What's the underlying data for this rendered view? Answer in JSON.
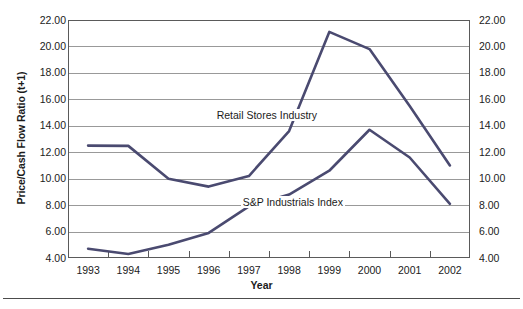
{
  "chart_data": {
    "type": "line",
    "title": "",
    "xlabel": "Year",
    "ylabel": "Price/Cash Flow Ratio (t+1)",
    "ylabel_right": "Price/Cash Flow Ratio (t+1)",
    "categories": [
      "1993",
      "1994",
      "1995",
      "1996",
      "1997",
      "1998",
      "1999",
      "2000",
      "2001",
      "2002"
    ],
    "x": [
      1993,
      1994,
      1995,
      1996,
      1997,
      1998,
      1999,
      2000,
      2001,
      2002
    ],
    "ylim": [
      4.0,
      22.0
    ],
    "ytick_values": [
      22.0,
      20.0,
      18.0,
      16.0,
      14.0,
      12.0,
      10.0,
      8.0,
      6.0,
      4.0
    ],
    "ytick_labels": [
      "22.00",
      "20.00",
      "18.00",
      "16.00",
      "14.00",
      "12.00",
      "10.00",
      "8.00",
      "6.00",
      "4.00"
    ],
    "ytick_labels_right": [
      "22.00",
      "20.00",
      "18.00",
      "16.00",
      "14.00",
      "12.00",
      "10.00",
      "8.00",
      "6.00",
      "4.00"
    ],
    "grid": true,
    "grid_axis": "y",
    "legend": "none",
    "legend_position": "inline-annotations",
    "series": [
      {
        "name": "Retail Stores Industry",
        "color": "#4a4a70",
        "values": [
          12.5,
          12.48,
          10.0,
          9.4,
          10.2,
          13.6,
          21.1,
          19.8,
          15.5,
          11.0
        ]
      },
      {
        "name": "S&P Industrials Index",
        "color": "#4a4a70",
        "values": [
          4.7,
          4.3,
          5.0,
          5.9,
          7.9,
          8.8,
          10.6,
          13.7,
          11.6,
          8.1
        ]
      }
    ],
    "annotations": [
      {
        "text": "Retail Stores Industry",
        "series": "Retail Stores Industry"
      },
      {
        "text": "S&P Industrials Index",
        "series": "S&P Industrials Index"
      }
    ]
  },
  "axes": {
    "y_title": "Price/Cash Flow Ratio (t+1)",
    "x_title": "Year"
  },
  "style": {
    "line_color": "#4a4a70",
    "grid_color": "#999999",
    "frame_color": "#5a5a5a",
    "text_color": "#1b1b1b",
    "rule_color": "#4c4c4c",
    "background": "#ffffff"
  }
}
